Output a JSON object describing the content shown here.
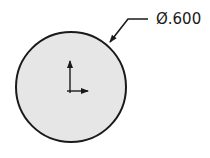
{
  "drawing": {
    "feature": "circle",
    "dimension": {
      "label": "Ø.600",
      "type": "diameter"
    },
    "colors": {
      "fill": "#e6e6e6",
      "stroke": "#1a1a1a",
      "background": "#ffffff"
    },
    "origin_marker": {
      "x_axis": "right-arrow",
      "y_axis": "up-arrow"
    }
  }
}
